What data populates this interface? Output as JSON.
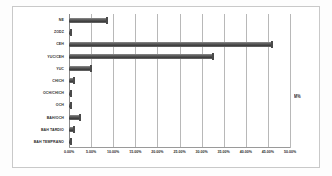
{
  "chart_data": {
    "type": "bar",
    "orientation": "horizontal",
    "title": "",
    "xlabel": "",
    "ylabel": "",
    "xlim": [
      0,
      50
    ],
    "grid": true,
    "legend_position": "right",
    "legend": [
      "M%"
    ],
    "xticks": [
      "0.00%",
      "5.00%",
      "10.00%",
      "15.00%",
      "20.00%",
      "25.00%",
      "30.00%",
      "35.00%",
      "40.00%",
      "45.00%",
      "50.00%"
    ],
    "xtick_values": [
      0,
      5,
      10,
      15,
      20,
      25,
      30,
      35,
      40,
      45,
      50
    ],
    "categories": [
      "NE",
      "ZODZ",
      "CEH",
      "YUC/CEH",
      "YUC",
      "CHICH",
      "OCH/CHICH",
      "OCH",
      "BAH/OCH",
      "BAH TARDIO",
      "BAH TEMPRANO"
    ],
    "values": [
      8.5,
      0.5,
      46.0,
      32.5,
      5.0,
      1.2,
      0.4,
      0.4,
      2.5,
      1.2,
      0.4
    ],
    "series": [
      {
        "name": "M%",
        "values": [
          8.5,
          0.5,
          46.0,
          32.5,
          5.0,
          1.2,
          0.4,
          0.4,
          2.5,
          1.2,
          0.4
        ]
      }
    ],
    "bar_color": "#4a4a4a",
    "gridline_color": "#b8b8b8",
    "plot_background": "#ffffff"
  }
}
